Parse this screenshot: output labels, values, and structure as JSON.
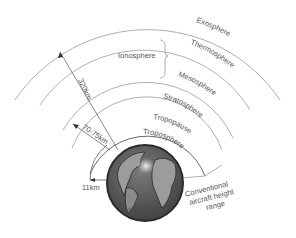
{
  "diagram": {
    "layers": [
      {
        "name": "Exosphere"
      },
      {
        "name": "Thermosphere"
      },
      {
        "name": "Mesosphere"
      },
      {
        "name": "Stratosphere"
      },
      {
        "name": "Tropopause"
      },
      {
        "name": "Troposphere"
      }
    ],
    "bracket_label": "Ionosphere",
    "heights": {
      "outer": "320km",
      "middle": "70-75km",
      "inner": "11km"
    },
    "aircraft_label": [
      "Conventional",
      "aircraft height",
      "range"
    ],
    "colors": {
      "arc": "#9a9a9a",
      "text": "#555555",
      "earth_ocean": "#5a5a5a",
      "earth_land": "#9c9c9c",
      "earth_outline": "#2a2a2a"
    }
  }
}
